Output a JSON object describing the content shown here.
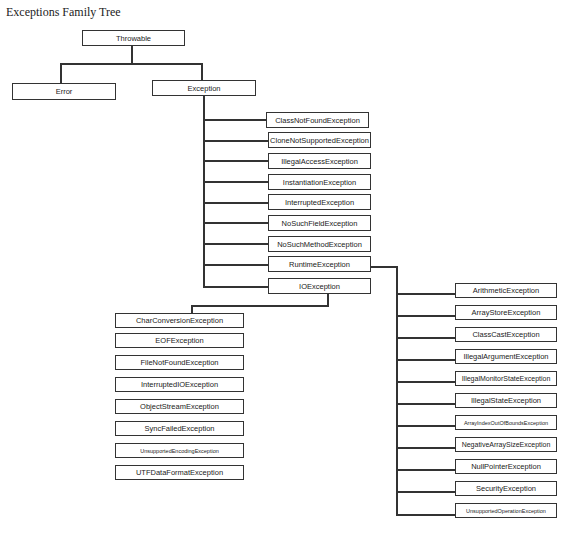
{
  "title": "Exceptions Family Tree",
  "root": {
    "label": "Throwable"
  },
  "level1": [
    {
      "label": "Error"
    },
    {
      "label": "Exception"
    }
  ],
  "exception_children": [
    {
      "label": "ClassNotFoundException"
    },
    {
      "label": "CloneNotSupportedException"
    },
    {
      "label": "IllegalAccessException"
    },
    {
      "label": "InstantiationException"
    },
    {
      "label": "InterruptedException"
    },
    {
      "label": "NoSuchFieldException"
    },
    {
      "label": "NoSuchMethodException"
    },
    {
      "label": "RuntimeException"
    },
    {
      "label": "IOException"
    }
  ],
  "ioexception_children": [
    {
      "label": "CharConversionException"
    },
    {
      "label": "EOFException"
    },
    {
      "label": "FileNotFoundException"
    },
    {
      "label": "InterruptedIOException"
    },
    {
      "label": "ObjectStreamException"
    },
    {
      "label": "SyncFailedException"
    },
    {
      "label": "UnsupportedEncodingException"
    },
    {
      "label": "UTFDataFormatException"
    }
  ],
  "runtime_children": [
    {
      "label": "ArithmeticException"
    },
    {
      "label": "ArrayStoreException"
    },
    {
      "label": "ClassCastException"
    },
    {
      "label": "IllegalArgumentException"
    },
    {
      "label": "IllegalMonitorStateException"
    },
    {
      "label": "IllegalStateException"
    },
    {
      "label": "ArrayIndexOutOfBoundsException"
    },
    {
      "label": "NegativeArraySizeException"
    },
    {
      "label": "NullPointerException"
    },
    {
      "label": "SecurityException"
    },
    {
      "label": "UnsupportedOperationException"
    }
  ]
}
